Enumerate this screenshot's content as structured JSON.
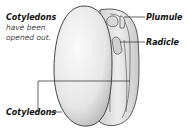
{
  "diagram": {
    "labels": {
      "cotyledons_top": {
        "title": "Cotyledons",
        "note_line1": "have been",
        "note_line2": "opened out."
      },
      "plumule": "Plumule",
      "radicle": "Radicle",
      "cotyledons_bottom": "Cotyledons"
    },
    "colors": {
      "seed_fill_light": "#f4f4f4",
      "seed_fill_shade": "#cfcfcf",
      "outline": "#333333",
      "text": "#111111"
    }
  }
}
